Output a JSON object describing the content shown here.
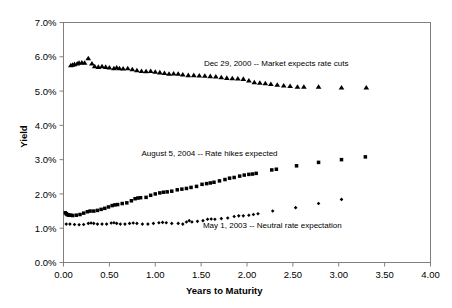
{
  "chart_data": {
    "type": "scatter",
    "title": "",
    "xlabel": "Years to Maturity",
    "ylabel": "Yield",
    "xlim": [
      0.0,
      4.0
    ],
    "ylim": [
      0.0,
      0.07
    ],
    "grid": false,
    "legend_position": "none",
    "xticks": [
      "0.00",
      "0.50",
      "1.00",
      "1.50",
      "2.00",
      "2.50",
      "3.00",
      "3.50",
      "4.00"
    ],
    "xtick_values": [
      0.0,
      0.5,
      1.0,
      1.5,
      2.0,
      2.5,
      3.0,
      3.5,
      4.0
    ],
    "yticks": [
      "0.0%",
      "1.0%",
      "2.0%",
      "3.0%",
      "4.0%",
      "5.0%",
      "6.0%",
      "7.0%"
    ],
    "ytick_values": [
      0.0,
      1.0,
      2.0,
      3.0,
      4.0,
      5.0,
      6.0,
      7.0
    ],
    "annotations": [
      {
        "name": "annotation-dec-2000",
        "text": "Dec 29, 2000 -- Market expects rate cuts",
        "x": 1.53,
        "y": 5.72,
        "anchor": "start"
      },
      {
        "name": "annotation-aug-2004",
        "text": "August 5, 2004 -- Rate hikes expected",
        "x": 0.85,
        "y": 3.12,
        "anchor": "start"
      },
      {
        "name": "annotation-may-2003",
        "text": "May 1, 2003 -- Neutral rate expectation",
        "x": 1.52,
        "y": 1.02,
        "anchor": "start"
      }
    ],
    "series": [
      {
        "name": "Dec 29, 2000",
        "marker": "triangle",
        "color": "#000000",
        "points": [
          [
            0.08,
            5.75
          ],
          [
            0.1,
            5.76
          ],
          [
            0.12,
            5.78
          ],
          [
            0.15,
            5.8
          ],
          [
            0.17,
            5.82
          ],
          [
            0.2,
            5.83
          ],
          [
            0.23,
            5.82
          ],
          [
            0.27,
            5.95
          ],
          [
            0.31,
            5.8
          ],
          [
            0.34,
            5.72
          ],
          [
            0.38,
            5.7
          ],
          [
            0.42,
            5.72
          ],
          [
            0.46,
            5.7
          ],
          [
            0.5,
            5.68
          ],
          [
            0.55,
            5.66
          ],
          [
            0.58,
            5.68
          ],
          [
            0.61,
            5.66
          ],
          [
            0.65,
            5.65
          ],
          [
            0.7,
            5.66
          ],
          [
            0.75,
            5.63
          ],
          [
            0.8,
            5.6
          ],
          [
            0.85,
            5.58
          ],
          [
            0.9,
            5.57
          ],
          [
            0.95,
            5.58
          ],
          [
            1.0,
            5.56
          ],
          [
            1.05,
            5.54
          ],
          [
            1.1,
            5.52
          ],
          [
            1.15,
            5.5
          ],
          [
            1.2,
            5.51
          ],
          [
            1.25,
            5.5
          ],
          [
            1.3,
            5.48
          ],
          [
            1.36,
            5.46
          ],
          [
            1.42,
            5.46
          ],
          [
            1.48,
            5.45
          ],
          [
            1.54,
            5.44
          ],
          [
            1.6,
            5.43
          ],
          [
            1.66,
            5.42
          ],
          [
            1.72,
            5.4
          ],
          [
            1.78,
            5.38
          ],
          [
            1.84,
            5.37
          ],
          [
            1.9,
            5.36
          ],
          [
            1.96,
            5.35
          ],
          [
            2.02,
            5.3
          ],
          [
            2.08,
            5.25
          ],
          [
            2.14,
            5.24
          ],
          [
            2.2,
            5.22
          ],
          [
            2.26,
            5.2
          ],
          [
            2.33,
            5.18
          ],
          [
            2.4,
            5.16
          ],
          [
            2.47,
            5.14
          ],
          [
            2.55,
            5.12
          ],
          [
            2.62,
            5.12
          ],
          [
            2.78,
            5.12
          ],
          [
            3.03,
            5.1
          ],
          [
            3.3,
            5.1
          ]
        ]
      },
      {
        "name": "August 5, 2004",
        "marker": "square",
        "color": "#000000",
        "points": [
          [
            0.02,
            1.45
          ],
          [
            0.03,
            1.42
          ],
          [
            0.04,
            1.4
          ],
          [
            0.05,
            1.39
          ],
          [
            0.06,
            1.38
          ],
          [
            0.08,
            1.38
          ],
          [
            0.1,
            1.37
          ],
          [
            0.14,
            1.38
          ],
          [
            0.18,
            1.4
          ],
          [
            0.22,
            1.44
          ],
          [
            0.26,
            1.48
          ],
          [
            0.29,
            1.5
          ],
          [
            0.33,
            1.5
          ],
          [
            0.37,
            1.52
          ],
          [
            0.41,
            1.55
          ],
          [
            0.45,
            1.58
          ],
          [
            0.49,
            1.62
          ],
          [
            0.53,
            1.66
          ],
          [
            0.56,
            1.68
          ],
          [
            0.59,
            1.69
          ],
          [
            0.64,
            1.72
          ],
          [
            0.69,
            1.74
          ],
          [
            0.74,
            1.8
          ],
          [
            0.78,
            1.86
          ],
          [
            0.81,
            1.88
          ],
          [
            0.84,
            1.89
          ],
          [
            0.9,
            1.9
          ],
          [
            0.95,
            1.96
          ],
          [
            1.0,
            2.0
          ],
          [
            1.05,
            2.03
          ],
          [
            1.09,
            2.05
          ],
          [
            1.13,
            2.06
          ],
          [
            1.18,
            2.08
          ],
          [
            1.24,
            2.12
          ],
          [
            1.29,
            2.14
          ],
          [
            1.34,
            2.16
          ],
          [
            1.39,
            2.19
          ],
          [
            1.45,
            2.22
          ],
          [
            1.51,
            2.28
          ],
          [
            1.56,
            2.3
          ],
          [
            1.6,
            2.32
          ],
          [
            1.64,
            2.34
          ],
          [
            1.7,
            2.38
          ],
          [
            1.76,
            2.42
          ],
          [
            1.81,
            2.46
          ],
          [
            1.86,
            2.48
          ],
          [
            1.92,
            2.52
          ],
          [
            1.97,
            2.55
          ],
          [
            2.02,
            2.57
          ],
          [
            2.06,
            2.58
          ],
          [
            2.1,
            2.6
          ],
          [
            2.27,
            2.7
          ],
          [
            2.32,
            2.72
          ],
          [
            2.54,
            2.82
          ],
          [
            2.78,
            2.92
          ],
          [
            3.03,
            3.0
          ],
          [
            3.29,
            3.08
          ]
        ]
      },
      {
        "name": "May 1, 2003",
        "marker": "diamond",
        "color": "#000000",
        "points": [
          [
            0.03,
            1.12
          ],
          [
            0.07,
            1.12
          ],
          [
            0.12,
            1.11
          ],
          [
            0.17,
            1.1
          ],
          [
            0.22,
            1.11
          ],
          [
            0.27,
            1.14
          ],
          [
            0.3,
            1.15
          ],
          [
            0.33,
            1.14
          ],
          [
            0.37,
            1.12
          ],
          [
            0.42,
            1.12
          ],
          [
            0.47,
            1.12
          ],
          [
            0.52,
            1.15
          ],
          [
            0.55,
            1.16
          ],
          [
            0.58,
            1.14
          ],
          [
            0.62,
            1.12
          ],
          [
            0.67,
            1.12
          ],
          [
            0.72,
            1.14
          ],
          [
            0.76,
            1.15
          ],
          [
            0.8,
            1.14
          ],
          [
            0.86,
            1.12
          ],
          [
            0.92,
            1.12
          ],
          [
            0.98,
            1.14
          ],
          [
            1.04,
            1.16
          ],
          [
            1.08,
            1.17
          ],
          [
            1.12,
            1.16
          ],
          [
            1.18,
            1.14
          ],
          [
            1.25,
            1.14
          ],
          [
            1.3,
            1.12
          ],
          [
            1.34,
            1.18
          ],
          [
            1.37,
            1.22
          ],
          [
            1.4,
            1.18
          ],
          [
            1.46,
            1.2
          ],
          [
            1.52,
            1.22
          ],
          [
            1.57,
            1.26
          ],
          [
            1.61,
            1.27
          ],
          [
            1.65,
            1.26
          ],
          [
            1.72,
            1.28
          ],
          [
            1.79,
            1.3
          ],
          [
            1.86,
            1.34
          ],
          [
            1.91,
            1.36
          ],
          [
            1.96,
            1.36
          ],
          [
            2.02,
            1.38
          ],
          [
            2.07,
            1.4
          ],
          [
            2.12,
            1.42
          ],
          [
            2.28,
            1.5
          ],
          [
            2.53,
            1.6
          ],
          [
            2.78,
            1.72
          ],
          [
            3.03,
            1.84
          ]
        ]
      }
    ]
  },
  "axes": {
    "y_title": "Yield",
    "x_title": "Years to Maturity"
  }
}
